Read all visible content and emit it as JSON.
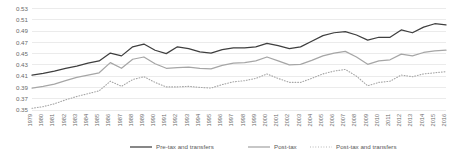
{
  "chart_data": {
    "type": "line",
    "title": "",
    "xlabel": "",
    "ylabel": "",
    "ylim": [
      0.35,
      0.53
    ],
    "ytick_step": 0.02,
    "grid": true,
    "legend_position": "bottom",
    "ytick_labels": [
      "0.35",
      "0.37",
      "0.39",
      "0.41",
      "0.43",
      "0.45",
      "0.47",
      "0.49",
      "0.51",
      "0.53"
    ],
    "ytick_values": [
      0.35,
      0.37,
      0.39,
      0.41,
      0.43,
      0.45,
      0.47,
      0.49,
      0.51,
      0.53
    ],
    "categories": [
      "1979",
      "1980",
      "1981",
      "1982",
      "1983",
      "1984",
      "1985",
      "1986",
      "1987",
      "1988",
      "1989",
      "1990",
      "1991",
      "1992",
      "1993",
      "1994",
      "1995",
      "1996",
      "1997",
      "1998",
      "1999",
      "2000",
      "2001",
      "2002",
      "2003",
      "2004",
      "2005",
      "2006",
      "2007",
      "2008",
      "2009",
      "2010",
      "2011",
      "2012",
      "2013",
      "2014",
      "2015",
      "2016"
    ],
    "series": [
      {
        "name": "Pre-tax and transfers",
        "color": "#3f3f3f",
        "style": "solid",
        "values": [
          0.412,
          0.415,
          0.419,
          0.424,
          0.428,
          0.433,
          0.437,
          0.451,
          0.446,
          0.462,
          0.467,
          0.456,
          0.45,
          0.462,
          0.459,
          0.453,
          0.451,
          0.457,
          0.46,
          0.46,
          0.462,
          0.468,
          0.464,
          0.459,
          0.462,
          0.472,
          0.482,
          0.487,
          0.489,
          0.483,
          0.474,
          0.479,
          0.479,
          0.492,
          0.487,
          0.497,
          0.503,
          0.501
        ]
      },
      {
        "name": "Post-tax",
        "color": "#a6a6a6",
        "style": "solid",
        "values": [
          0.389,
          0.392,
          0.396,
          0.402,
          0.408,
          0.412,
          0.416,
          0.434,
          0.424,
          0.44,
          0.444,
          0.432,
          0.424,
          0.425,
          0.426,
          0.424,
          0.423,
          0.429,
          0.433,
          0.434,
          0.437,
          0.444,
          0.437,
          0.43,
          0.431,
          0.438,
          0.446,
          0.451,
          0.454,
          0.444,
          0.431,
          0.437,
          0.439,
          0.449,
          0.446,
          0.452,
          0.455,
          0.456
        ]
      },
      {
        "name": "Post-tax and transfers",
        "color": "#a6a6a6",
        "style": "dotted",
        "values": [
          0.353,
          0.356,
          0.361,
          0.368,
          0.374,
          0.379,
          0.384,
          0.401,
          0.392,
          0.404,
          0.409,
          0.399,
          0.391,
          0.391,
          0.392,
          0.39,
          0.389,
          0.395,
          0.4,
          0.402,
          0.406,
          0.414,
          0.406,
          0.399,
          0.399,
          0.406,
          0.414,
          0.419,
          0.422,
          0.41,
          0.393,
          0.399,
          0.401,
          0.412,
          0.409,
          0.414,
          0.416,
          0.418
        ]
      }
    ],
    "legend": [
      {
        "label": "Pre-tax and transfers",
        "color": "#3f3f3f",
        "style": "solid"
      },
      {
        "label": "Post-tax",
        "color": "#a6a6a6",
        "style": "solid"
      },
      {
        "label": "Post-tax and transfers",
        "color": "#a6a6a6",
        "style": "dotted"
      }
    ]
  }
}
